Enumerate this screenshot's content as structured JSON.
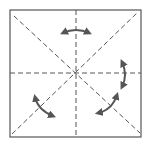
{
  "diagram": {
    "type": "origami-fold-diagram",
    "square": {
      "x": 10,
      "y": 10,
      "width": 131,
      "height": 127,
      "stroke": "#555555"
    },
    "fold_lines": [
      {
        "name": "vertical-crease",
        "style": "dashed"
      },
      {
        "name": "horizontal-crease",
        "style": "dashed"
      },
      {
        "name": "diagonal-crease-tl-br",
        "style": "dashed"
      },
      {
        "name": "diagonal-crease-bl-tr",
        "style": "dashed"
      }
    ],
    "arrows": [
      {
        "name": "top-rotate-arrow",
        "position": "top",
        "direction": "bidirectional-curved"
      },
      {
        "name": "right-rotate-arrow",
        "position": "right",
        "direction": "bidirectional-curved"
      },
      {
        "name": "bottom-left-rotate-arrow",
        "position": "bottom-left",
        "direction": "bidirectional-curved"
      },
      {
        "name": "bottom-right-rotate-arrow",
        "position": "bottom-right",
        "direction": "bidirectional-curved"
      }
    ],
    "colors": {
      "line": "#555555",
      "arrow": "#555555",
      "background": "#ffffff"
    }
  }
}
